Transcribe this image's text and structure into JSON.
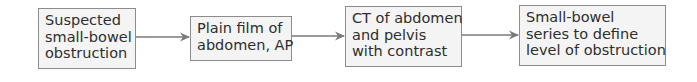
{
  "diagram": {
    "type": "flowchart",
    "direction": "left-to-right",
    "colors": {
      "box_fill": "#f4f4f4",
      "box_border": "#8c8c8c",
      "text": "#2e2e2e",
      "arrow": "#7a7a7a"
    },
    "nodes": [
      {
        "id": "n1",
        "lines": [
          "Suspected",
          "small-bowel",
          "obstruction"
        ]
      },
      {
        "id": "n2",
        "lines": [
          "Plain film of",
          "abdomen, AP"
        ]
      },
      {
        "id": "n3",
        "lines": [
          "CT of abdomen",
          "and pelvis",
          "with contrast"
        ]
      },
      {
        "id": "n4",
        "lines": [
          "Small-bowel",
          "series to define",
          "level of obstruction"
        ]
      }
    ],
    "edges": [
      {
        "from": "n1",
        "to": "n2"
      },
      {
        "from": "n2",
        "to": "n3"
      },
      {
        "from": "n3",
        "to": "n4"
      }
    ]
  }
}
